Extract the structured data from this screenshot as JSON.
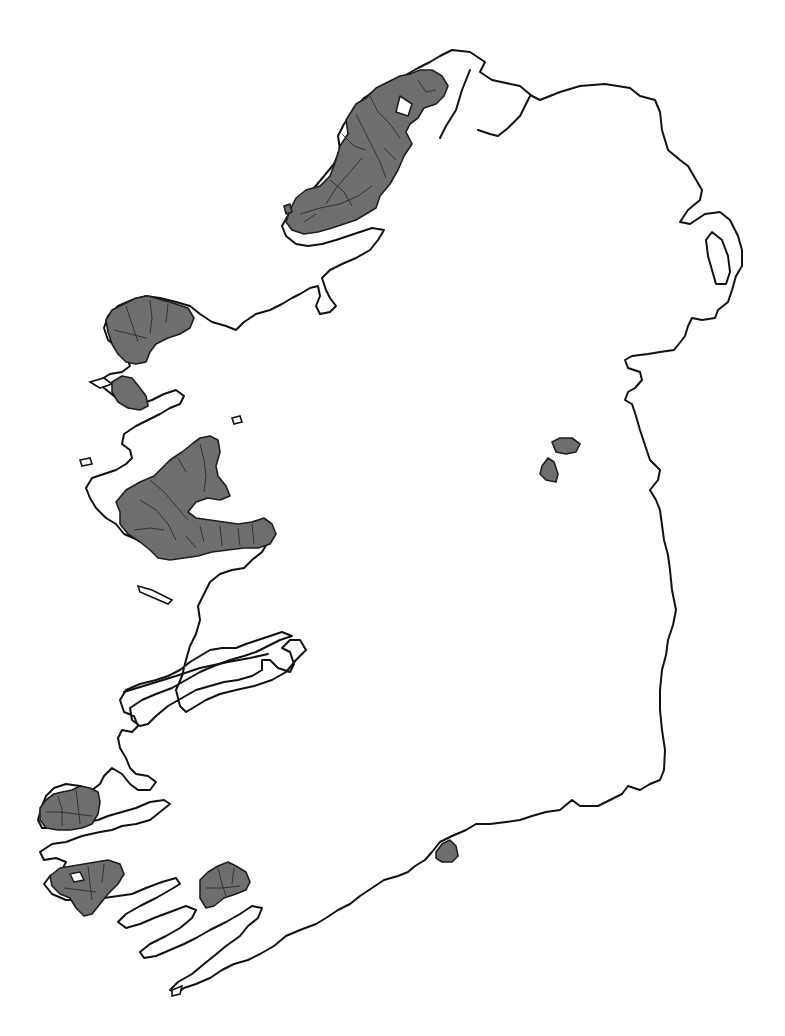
{
  "map": {
    "subject": "Ireland",
    "description": "Outline map of Ireland with Gaeltacht (Irish-speaking) areas shaded",
    "colors": {
      "background": "#ffffff",
      "coastline": "#111111",
      "gaeltacht_fill": "#6e6e6e",
      "region_border": "#1e1e1e"
    },
    "shaded_regions": [
      {
        "name": "donegal",
        "label": "Donegal Gaeltacht"
      },
      {
        "name": "mayo-north",
        "label": "North Mayo Gaeltacht"
      },
      {
        "name": "mayo-achill",
        "label": "Achill / Tourmakeady Gaeltacht"
      },
      {
        "name": "galway",
        "label": "Galway / Connemara Gaeltacht"
      },
      {
        "name": "meath",
        "label": "Meath Gaeltacht"
      },
      {
        "name": "kerry-dingle",
        "label": "Dingle Peninsula Gaeltacht"
      },
      {
        "name": "kerry-iveragh",
        "label": "Iveragh Gaeltacht"
      },
      {
        "name": "cork",
        "label": "Cork Gaeltacht"
      },
      {
        "name": "waterford",
        "label": "Waterford Gaeltacht"
      }
    ]
  }
}
